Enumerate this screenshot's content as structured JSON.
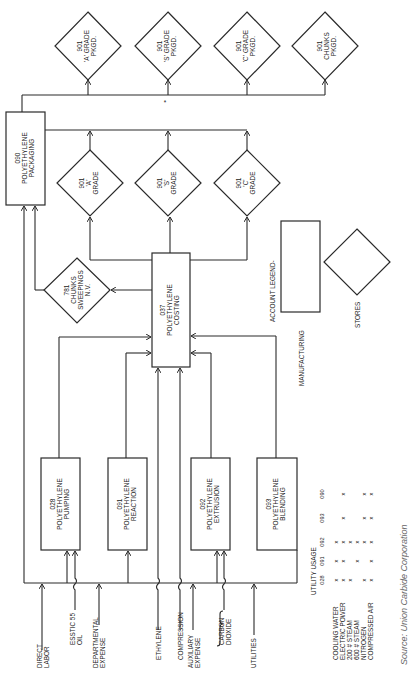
{
  "diagram": {
    "orientation": "rotated 90deg counter-clockwise",
    "packaged_stores": [
      {
        "code": "901",
        "line1": "'A' GRADE",
        "line2": "PKGD."
      },
      {
        "code": "901",
        "line1": "'S' GRADE",
        "line2": "PKGD."
      },
      {
        "code": "901",
        "line1": "'C' GRADE",
        "line2": "PKGD."
      },
      {
        "code": "901",
        "line1": "CHUNKS",
        "line2": "PKGD."
      }
    ],
    "packaging": {
      "code": "090",
      "line1": "POLYETHYLENE",
      "line2": "PACKAGING"
    },
    "grade_stores": [
      {
        "code": "901",
        "line1": "'A'",
        "line2": "GRADE"
      },
      {
        "code": "901",
        "line1": "'S'",
        "line2": "GRADE"
      },
      {
        "code": "901",
        "line1": "'C'",
        "line2": "GRADE"
      }
    ],
    "chunks_store": {
      "code": "781",
      "line1": "CHUNKS",
      "line2": "SWEEPINGS",
      "line3": "N.V."
    },
    "costing": {
      "code": "037",
      "line1": "POLYETHYLENE",
      "line2": "COSTING"
    },
    "departments": [
      {
        "code": "028",
        "line1": "POLYETHYLENE",
        "line2": "PUMPING"
      },
      {
        "code": "091",
        "line1": "POLYETHYLENE",
        "line2": "REACTION"
      },
      {
        "code": "092",
        "line1": "POLYETHYLENE",
        "line2": "EXTRUSION"
      },
      {
        "code": "093",
        "line1": "POLYETHYLENE",
        "line2": "BLENDING"
      }
    ],
    "inputs": {
      "direct_labor": [
        "DIRECT",
        "LABOR"
      ],
      "esstic_oil": [
        "ESSTIC 55",
        "OIL"
      ],
      "departmental_expense": [
        "DEPARTMENTAL",
        "EXPENSE"
      ],
      "ethylene": [
        "ETHYLENE"
      ],
      "compression": [
        "COMPRESSION"
      ],
      "auxiliary_expense": [
        "AUXILIARY",
        "EXPENSE"
      ],
      "carbon_dioxide": [
        "CARBON",
        "DIOXIDE"
      ],
      "utilities": [
        "UTILITIES"
      ]
    },
    "legend": {
      "title": "ACCOUNT LEGEND-",
      "manufacturing": "MANUFACTURING",
      "stores": "STORES"
    },
    "utility_usage": {
      "title": "UTILITY USAGE",
      "columns": [
        "028",
        "091",
        "092",
        "093",
        "090"
      ],
      "rows": [
        {
          "label": "COOLING WATER",
          "marks": [
            "x",
            "x",
            "x",
            "",
            ""
          ]
        },
        {
          "label": "ELECTRIC POWER",
          "marks": [
            "x",
            "x",
            "x",
            "x",
            "x"
          ]
        },
        {
          "label": "200 # STEAM",
          "marks": [
            "x",
            "",
            "x",
            "",
            ""
          ]
        },
        {
          "label": "600 # STEAM",
          "marks": [
            "",
            "x",
            "x",
            "",
            ""
          ]
        },
        {
          "label": "NITROGEN",
          "marks": [
            "x",
            "",
            "x",
            "x",
            "x"
          ]
        },
        {
          "label": "COMPRESSED AIR",
          "marks": [
            "x",
            "x",
            "x",
            "x",
            "x"
          ]
        }
      ]
    },
    "source": "Source: Union Carbide Corporation",
    "asterisk": "*"
  }
}
